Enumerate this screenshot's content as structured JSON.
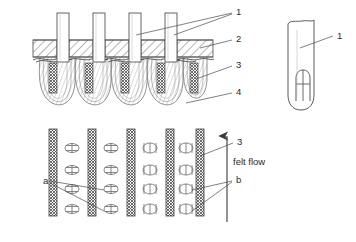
{
  "figure": {
    "colors": {
      "line": "#4a4a4a",
      "line_dark": "#333333",
      "hatch": "#6e6e6e",
      "mesh": "#555555",
      "background": "#ffffff",
      "text": "#2a2a2a"
    }
  },
  "panels": {
    "main": {
      "name": "needle-loom-cross-section",
      "callouts": [
        {
          "id": "1",
          "label": "1",
          "x": 236,
          "y": 11,
          "target": "needles"
        },
        {
          "id": "2",
          "label": "2",
          "x": 236,
          "y": 38,
          "target": "stripper-plate"
        },
        {
          "id": "3",
          "label": "3",
          "x": 236,
          "y": 64,
          "target": "web-column"
        },
        {
          "id": "4",
          "label": "4",
          "x": 236,
          "y": 91,
          "target": "fiber-loop"
        }
      ],
      "needle_count": 4,
      "loop_count": 5
    },
    "detail": {
      "name": "needle-detail",
      "callouts": [
        {
          "id": "1",
          "label": "1",
          "x": 337,
          "y": 35,
          "target": "needle-blade"
        }
      ]
    },
    "lower": {
      "name": "felt-layers-plan-view",
      "column_count": 5,
      "tuft_columns": 4,
      "tuft_rows": 4,
      "callouts": [
        {
          "id": "a",
          "label": "a",
          "x": 43,
          "y": 180,
          "target": "tuft-group-a"
        },
        {
          "id": "b",
          "label": "b",
          "x": 236,
          "y": 179,
          "target": "tuft-group-b"
        },
        {
          "id": "3",
          "label": "3",
          "x": 237,
          "y": 141,
          "target": "web-column"
        }
      ],
      "flow_label": "felt flow",
      "flow_label_x": 233,
      "flow_label_y": 161,
      "flow_direction": "up"
    }
  }
}
